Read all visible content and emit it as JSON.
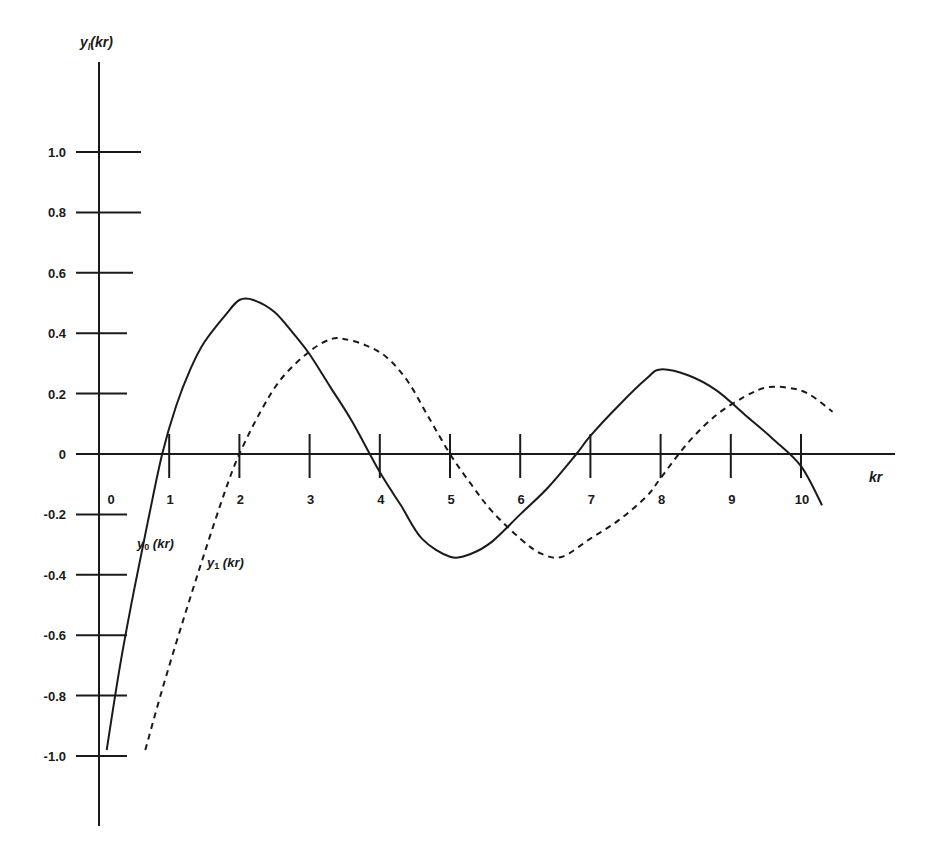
{
  "chart_data": {
    "type": "line",
    "title": "",
    "xlabel": "kr",
    "ylabel": "y_l(kr)",
    "xlim": [
      0,
      11.2
    ],
    "ylim": [
      -1.2,
      1.3
    ],
    "grid": false,
    "legend": "inline labels near curves",
    "x_ticks": [
      "0",
      "1",
      "2",
      "3",
      "4",
      "5",
      "6",
      "7",
      "8",
      "9",
      "10"
    ],
    "y_ticks": [
      "1.0",
      "0.8",
      "0.6",
      "0.4",
      "0.2",
      "0",
      "-0.2",
      "-0.4",
      "-0.6",
      "-0.8",
      "-1.0"
    ],
    "series": [
      {
        "name": "y0 (kr)",
        "style": "solid",
        "x": [
          0.11,
          0.3,
          0.5,
          0.7,
          0.9,
          1.1,
          1.3,
          1.5,
          1.8,
          2.0,
          2.2,
          2.5,
          2.8,
          3.0,
          3.3,
          3.6,
          4.0,
          4.3,
          4.6,
          5.0,
          5.3,
          5.6,
          6.0,
          6.4,
          6.8,
          7.0,
          7.4,
          7.8,
          8.0,
          8.4,
          8.8,
          9.2,
          9.6,
          10.0,
          10.3
        ],
        "y": [
          -0.98,
          -0.7,
          -0.45,
          -0.22,
          0.0,
          0.16,
          0.28,
          0.37,
          0.46,
          0.51,
          0.51,
          0.47,
          0.39,
          0.33,
          0.22,
          0.11,
          -0.06,
          -0.17,
          -0.28,
          -0.34,
          -0.33,
          -0.29,
          -0.2,
          -0.11,
          0.0,
          0.06,
          0.16,
          0.25,
          0.28,
          0.26,
          0.21,
          0.13,
          0.05,
          -0.04,
          -0.17
        ]
      },
      {
        "name": "y1 (kr)",
        "style": "dashed",
        "x": [
          0.66,
          0.9,
          1.2,
          1.5,
          1.8,
          2.0,
          2.3,
          2.6,
          3.0,
          3.3,
          3.5,
          3.8,
          4.1,
          4.4,
          4.7,
          5.0,
          5.3,
          5.6,
          6.0,
          6.3,
          6.6,
          7.0,
          7.4,
          7.8,
          8.0,
          8.4,
          8.8,
          9.2,
          9.5,
          9.8,
          10.1,
          10.45
        ],
        "y": [
          -0.98,
          -0.78,
          -0.55,
          -0.33,
          -0.12,
          0.0,
          0.14,
          0.25,
          0.34,
          0.38,
          0.38,
          0.36,
          0.32,
          0.24,
          0.12,
          0.0,
          -0.1,
          -0.19,
          -0.28,
          -0.33,
          -0.34,
          -0.28,
          -0.22,
          -0.14,
          -0.08,
          0.04,
          0.13,
          0.19,
          0.22,
          0.22,
          0.2,
          0.14
        ]
      }
    ],
    "annotations": [
      {
        "text": "y0 (kr)",
        "x": 0.56,
        "y": -0.3
      },
      {
        "text": "y1 (kr)",
        "x": 1.53,
        "y": -0.37
      }
    ]
  },
  "axis_labels": {
    "y_title_main": "y",
    "y_title_sub": "l",
    "y_title_rest": "(kr)",
    "x_title": "kr"
  },
  "curve_labels": {
    "y0_main": "y",
    "y0_sub": "0",
    "y0_rest": " (kr)",
    "y1_main": "y",
    "y1_sub": "1",
    "y1_rest": " (kr)"
  },
  "caption": {
    "text": "",
    "note": "caption line cut off at bottom edge"
  }
}
